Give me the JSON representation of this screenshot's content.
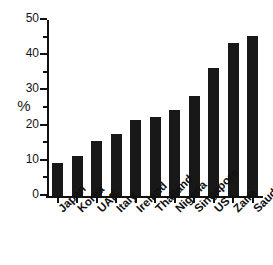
{
  "chart_data": {
    "type": "bar",
    "title": "",
    "subtitle": "",
    "xlabel": "",
    "ylabel": "%",
    "ylim": [
      0,
      50
    ],
    "ytick_values": [
      0,
      10,
      20,
      30,
      40,
      50
    ],
    "ytick_labels": [
      "0",
      "10",
      "20",
      "30",
      "40",
      "50"
    ],
    "yminor_values": [
      5,
      15,
      25,
      35,
      45
    ],
    "grid": false,
    "legend": null,
    "bar_color": "#181818",
    "categories": [
      "Japan",
      "Korea",
      "UAE",
      "Italy",
      "Ireland",
      "Thailand",
      "Nigeria",
      "Singapore",
      "US",
      "Zaire",
      "Saudi"
    ],
    "values": [
      9.5,
      11.5,
      15.5,
      17.5,
      21.5,
      22.5,
      24.5,
      28.5,
      36.5,
      43.5,
      45.5
    ],
    "annotations": []
  },
  "axes": {
    "y_axis_label": "%"
  }
}
